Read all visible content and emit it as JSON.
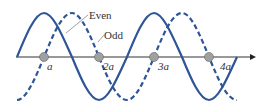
{
  "labels": {
    "even": "Even",
    "odd": "Odd"
  },
  "ticks": [
    "a",
    "2a",
    "3a",
    "4a"
  ],
  "colors": {
    "curve": "#2e5597",
    "axis": "#333333",
    "ball": "#9a9a9a"
  }
}
